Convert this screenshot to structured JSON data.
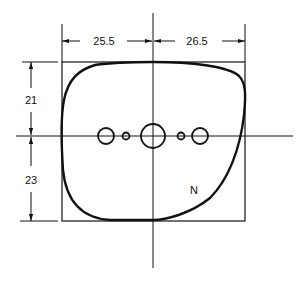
{
  "diagram": {
    "type": "technical-drawing",
    "colors": {
      "line": "#111111",
      "background": "#ffffff"
    },
    "dimensions": {
      "left_width": "25.5",
      "right_width": "26.5",
      "top_height": "21",
      "bottom_height": "23"
    },
    "annotations": {
      "region_label": "N"
    },
    "holes": [
      {
        "position": "far-left",
        "size": "medium"
      },
      {
        "position": "inner-left",
        "size": "small"
      },
      {
        "position": "center",
        "size": "large"
      },
      {
        "position": "inner-right",
        "size": "small"
      },
      {
        "position": "far-right",
        "size": "medium"
      }
    ]
  }
}
